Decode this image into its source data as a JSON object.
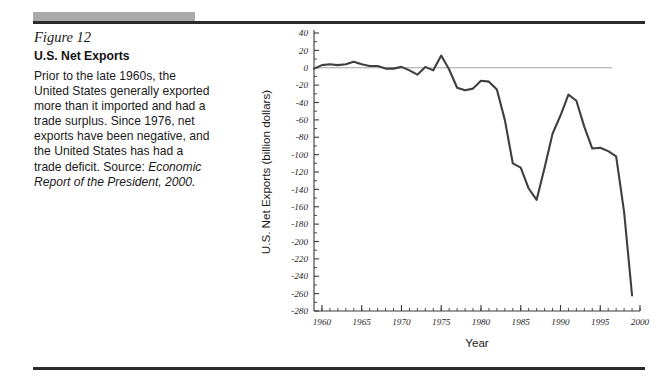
{
  "figure": {
    "number": "Figure 12",
    "title": "U.S. Net Exports",
    "body_text_1": "Prior to the late 1960s, the United States generally exported more than it imported and had a trade surplus. Since 1976, net exports have been negative, and the United States has had a trade deficit. Source: ",
    "body_source_italic": "Economic Report of the President, 2000."
  },
  "decor": {
    "gray_bar_color": "#aaaaaa",
    "rule_color": "#2b2b2b"
  },
  "chart_data": {
    "type": "line",
    "title": "",
    "xlabel": "Year",
    "ylabel": "U.S. Net Exports (billion dollars)",
    "xlim": [
      1959,
      2000
    ],
    "ylim": [
      -280,
      40
    ],
    "ytick_step": 20,
    "xtick_major_step": 5,
    "xtick_minor_step": 1,
    "grid": false,
    "legend": "none",
    "zero_reference_line": true,
    "line_color": "#3f3f3f",
    "ytick_labels": [
      "40",
      "20",
      "0",
      "-20",
      "-40",
      "-60",
      "-80",
      "-100",
      "-120",
      "-140",
      "-160",
      "-180",
      "-200",
      "-220",
      "-240",
      "-260",
      "-280"
    ],
    "ytick_values": [
      40,
      20,
      0,
      -20,
      -40,
      -60,
      -80,
      -100,
      -120,
      -140,
      -160,
      -180,
      -200,
      -220,
      -240,
      -260,
      -280
    ],
    "xtick_labels": [
      "1960",
      "1965",
      "1970",
      "1975",
      "1980",
      "1985",
      "1990",
      "1995",
      "2000"
    ],
    "xtick_values": [
      1960,
      1965,
      1970,
      1975,
      1980,
      1985,
      1990,
      1995,
      2000
    ],
    "x": [
      1959,
      1960,
      1961,
      1962,
      1963,
      1964,
      1965,
      1966,
      1967,
      1968,
      1969,
      1970,
      1971,
      1972,
      1973,
      1974,
      1975,
      1976,
      1977,
      1978,
      1979,
      1980,
      1981,
      1982,
      1983,
      1984,
      1985,
      1986,
      1987,
      1988,
      1989,
      1990,
      1991,
      1992,
      1993,
      1994,
      1995,
      1996,
      1997,
      1998,
      1999
    ],
    "values": [
      -1,
      3,
      4,
      3,
      4,
      7,
      4,
      2,
      2,
      -1,
      -1,
      1,
      -3,
      -8,
      1,
      -3,
      14,
      -2,
      -23,
      -26,
      -24,
      -15,
      -16,
      -25,
      -60,
      -110,
      -115,
      -139,
      -152,
      -115,
      -76,
      -55,
      -31,
      -38,
      -68,
      -93,
      -92,
      -96,
      -102,
      -166,
      -262
    ],
    "series": [
      {
        "name": "U.S. Net Exports",
        "values": [
          -1,
          3,
          4,
          3,
          4,
          7,
          4,
          2,
          2,
          -1,
          -1,
          1,
          -3,
          -8,
          1,
          -3,
          14,
          -2,
          -23,
          -26,
          -24,
          -15,
          -16,
          -25,
          -60,
          -110,
          -115,
          -139,
          -152,
          -115,
          -76,
          -55,
          -31,
          -38,
          -68,
          -93,
          -92,
          -96,
          -102,
          -166,
          -262
        ]
      }
    ]
  }
}
